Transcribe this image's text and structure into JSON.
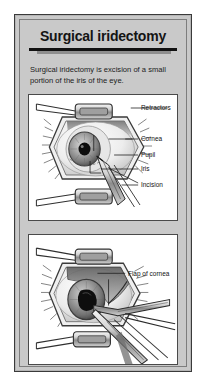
{
  "card": {
    "title": "Surgical iridectomy",
    "description": "Surgical iridectomy is excision of a small portion of the iris of the eye."
  },
  "panels": [
    {
      "name": "panel-eye-incision",
      "labels": [
        {
          "text": "Retractors",
          "key": "retractors"
        },
        {
          "text": "Cornea",
          "key": "cornea"
        },
        {
          "text": "Pupil",
          "key": "pupil"
        },
        {
          "text": "Iris",
          "key": "iris"
        },
        {
          "text": "Incision",
          "key": "incision"
        }
      ]
    },
    {
      "name": "panel-corneal-flap",
      "labels": [
        {
          "text": "Flap of cornea",
          "key": "flap-of-cornea"
        }
      ]
    }
  ],
  "colors": {
    "card_background": "#c9c9c9",
    "frame_border": "#3a3a3a",
    "panel_background": "#ffffff",
    "text": "#141414",
    "ink": "#1a1a1a"
  }
}
